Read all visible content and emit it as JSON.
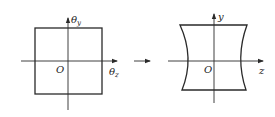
{
  "left_diagram": {
    "shape": "square",
    "vertical_axis_label": "θ",
    "vertical_axis_subscript": "y",
    "horizontal_axis_label": "θ",
    "horizontal_axis_subscript": "z",
    "origin_label": "O"
  },
  "transform_arrow": {
    "meaning": "maps-to"
  },
  "right_diagram": {
    "shape": "concave-sided quadrilateral (pincushion)",
    "vertical_axis_label": "y",
    "horizontal_axis_label": "z",
    "origin_label": "O"
  },
  "colors": {
    "stroke": "#2a2a2a",
    "background": "#ffffff"
  }
}
